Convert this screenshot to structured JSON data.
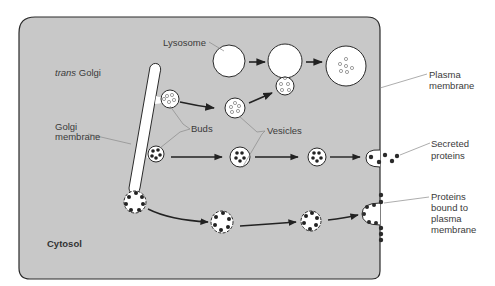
{
  "diagram": {
    "colors": {
      "cytosol": "#c8c8c8",
      "membrane": "#2a2a2a",
      "lumen": "#ffffff",
      "label": "#3a3a3a",
      "leader": "#8a8a8a",
      "protein": "#2a2a2a"
    },
    "labels": {
      "lysosome": "Lysosome",
      "trans_golgi_italic": "trans",
      "trans_golgi_rest": " Golgi",
      "golgi_membrane_1": "Golgi",
      "golgi_membrane_2": "membrane",
      "buds": "Buds",
      "vesicles": "Vesicles",
      "plasma_membrane_1": "Plasma",
      "plasma_membrane_2": "membrane",
      "secreted_1": "Secreted",
      "secreted_2": "proteins",
      "bound_1": "Proteins",
      "bound_2": "bound to",
      "bound_3": "plasma",
      "bound_4": "membrane",
      "cytosol": "Cytosol"
    },
    "pathways": [
      {
        "name": "lysosomal",
        "steps": [
          "bud",
          "vesicle",
          "fusion",
          "lysosome"
        ]
      },
      {
        "name": "secretory",
        "steps": [
          "bud",
          "vesicle",
          "vesicle",
          "exocytosis"
        ]
      },
      {
        "name": "membrane",
        "steps": [
          "bud",
          "vesicle",
          "vesicle",
          "membrane-fusion"
        ]
      }
    ]
  }
}
